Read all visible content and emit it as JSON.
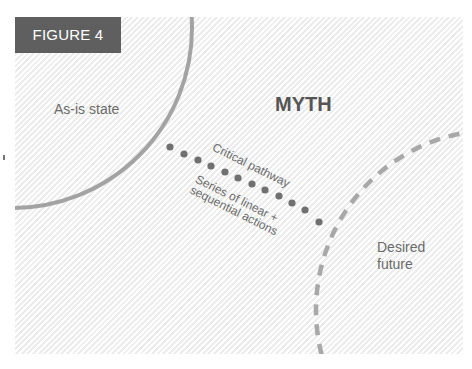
{
  "figure": {
    "label": "FIGURE 4",
    "title": "MYTH",
    "nodes": {
      "as_is": "As-is state",
      "desired": "Desired future"
    },
    "pathway": {
      "label": "Critical pathway",
      "description_line1": "Series of linear +",
      "description_line2": "sequential actions",
      "dot_count": 12
    },
    "colors": {
      "label_bg": "#5f5f5f",
      "label_text": "#ffffff",
      "shape_stroke": "#a0a0a0",
      "dots": "#707070",
      "text": "#6a6a6a"
    }
  }
}
